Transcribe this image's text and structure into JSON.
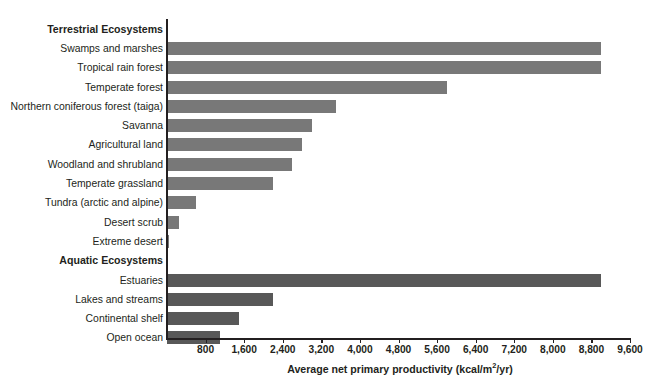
{
  "chart_data": {
    "type": "bar",
    "orientation": "horizontal",
    "title": "",
    "xlabel": "Average net primary productivity (kcal/m2/yr)",
    "xlabel_parts": {
      "before": "Average net primary productivity (kcal/m",
      "sup": "2",
      "after": "/yr)"
    },
    "ylabel": "",
    "xlim": [
      0,
      9600
    ],
    "xticks": [
      800,
      1600,
      2400,
      3200,
      4000,
      4800,
      5600,
      6400,
      7200,
      8000,
      8800,
      9600
    ],
    "xtick_labels": [
      "800",
      "1,600",
      "2,400",
      "3,200",
      "4,000",
      "4,800",
      "5,600",
      "6,400",
      "7,200",
      "8,000",
      "8,800",
      "9,600"
    ],
    "grid": false,
    "legend": false,
    "colors": {
      "terrestrial_bar": "#787878",
      "aquatic_bar": "#585858",
      "axis": "#231f20",
      "background": "#ffffff"
    },
    "groups": [
      {
        "name": "Terrestrial Ecosystems",
        "series_key": "terrestrial"
      },
      {
        "name": "Aquatic Ecosystems",
        "series_key": "aquatic"
      }
    ],
    "categories": [
      "Swamps and marshes",
      "Tropical rain forest",
      "Temperate forest",
      "Northern coniferous forest (taiga)",
      "Savanna",
      "Agricultural land",
      "Woodland and shrubland",
      "Temperate grassland",
      "Tundra (arctic and alpine)",
      "Desert scrub",
      "Extreme desert",
      "Estuaries",
      "Lakes and streams",
      "Continental shelf",
      "Open ocean"
    ],
    "values": [
      9000,
      9000,
      5800,
      3500,
      3000,
      2800,
      2600,
      2200,
      600,
      250,
      50,
      9000,
      2200,
      1500,
      1100
    ]
  },
  "rows": [
    {
      "kind": "group",
      "label": "Terrestrial Ecosystems"
    },
    {
      "kind": "bar",
      "label": "Swamps and marshes",
      "value": 9000,
      "series": "terrestrial"
    },
    {
      "kind": "bar",
      "label": "Tropical rain forest",
      "value": 9000,
      "series": "terrestrial"
    },
    {
      "kind": "bar",
      "label": "Temperate forest",
      "value": 5800,
      "series": "terrestrial"
    },
    {
      "kind": "bar",
      "label": "Northern coniferous forest (taiga)",
      "value": 3500,
      "series": "terrestrial"
    },
    {
      "kind": "bar",
      "label": "Savanna",
      "value": 3000,
      "series": "terrestrial"
    },
    {
      "kind": "bar",
      "label": "Agricultural land",
      "value": 2800,
      "series": "terrestrial"
    },
    {
      "kind": "bar",
      "label": "Woodland and shrubland",
      "value": 2600,
      "series": "terrestrial"
    },
    {
      "kind": "bar",
      "label": "Temperate grassland",
      "value": 2200,
      "series": "terrestrial"
    },
    {
      "kind": "bar",
      "label": "Tundra (arctic and alpine)",
      "value": 600,
      "series": "terrestrial"
    },
    {
      "kind": "bar",
      "label": "Desert scrub",
      "value": 250,
      "series": "terrestrial"
    },
    {
      "kind": "bar",
      "label": "Extreme desert",
      "value": 50,
      "series": "terrestrial"
    },
    {
      "kind": "group",
      "label": "Aquatic Ecosystems"
    },
    {
      "kind": "bar",
      "label": "Estuaries",
      "value": 9000,
      "series": "aquatic"
    },
    {
      "kind": "bar",
      "label": "Lakes and streams",
      "value": 2200,
      "series": "aquatic"
    },
    {
      "kind": "bar",
      "label": "Continental shelf",
      "value": 1500,
      "series": "aquatic"
    },
    {
      "kind": "bar",
      "label": "Open ocean",
      "value": 1100,
      "series": "aquatic"
    }
  ]
}
